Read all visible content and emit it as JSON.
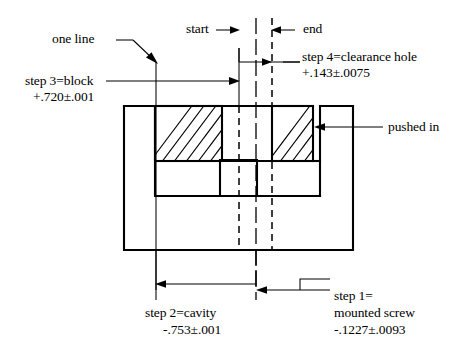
{
  "diagram": {
    "type": "engineering-tolerance-stack-drawing",
    "labels": {
      "one_line": "one line",
      "start": "start",
      "end": "end",
      "pushed_in": "pushed in",
      "step3_line1": "step 3=block",
      "step3_line2": "+.720±.001",
      "step4_line1": "step 4=clearance hole",
      "step4_line2": "+.143±.0075",
      "step2_line1": "step 2=cavity",
      "step2_line2": "-.753±.001",
      "step1_line1": "step 1=",
      "step1_line2": "mounted screw",
      "step1_line3": "-.1227±.0093"
    },
    "steps": [
      {
        "id": "step1",
        "name": "mounted screw",
        "nominal": "-.1227",
        "tolerance": "±.0093",
        "value": "-.1227±.0093"
      },
      {
        "id": "step2",
        "name": "cavity",
        "nominal": "-.753",
        "tolerance": "±.001",
        "value": "-.753±.001"
      },
      {
        "id": "step3",
        "name": "block",
        "nominal": "+.720",
        "tolerance": "±.001",
        "value": "+.720±.001"
      },
      {
        "id": "step4",
        "name": "clearance hole",
        "nominal": "+.143",
        "tolerance": "±.0075",
        "value": "+.143±.0075"
      }
    ],
    "colors": {
      "line": "#000000",
      "background": "#ffffff",
      "hatch_fill": "#ffffff"
    }
  }
}
